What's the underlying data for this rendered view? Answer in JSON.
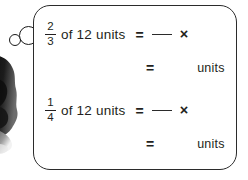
{
  "worksheet": {
    "title": "Fraction of a quantity worksheet",
    "box": {
      "border_color": "#2b2b2b",
      "background_color": "#ffffff"
    },
    "decorations": {
      "silhouette_name": "student-silhouette",
      "bubble_small_name": "thought-bubble-small",
      "bubble_large_name": "thought-bubble-large",
      "ink_color": "#1a1a1a"
    },
    "problems": [
      {
        "id": "problem-1",
        "fraction": {
          "numerator": "2",
          "denominator": "3"
        },
        "phrase": "of 12 units",
        "equals": "=",
        "answer_blank": "",
        "operator": "×",
        "result_equals": "=",
        "result_blank": "",
        "result_unit": "units"
      },
      {
        "id": "problem-2",
        "fraction": {
          "numerator": "1",
          "denominator": "4"
        },
        "phrase": "of 12 units",
        "equals": "=",
        "answer_blank": "",
        "operator": "×",
        "result_equals": "=",
        "result_blank": "",
        "result_unit": "units"
      }
    ]
  }
}
